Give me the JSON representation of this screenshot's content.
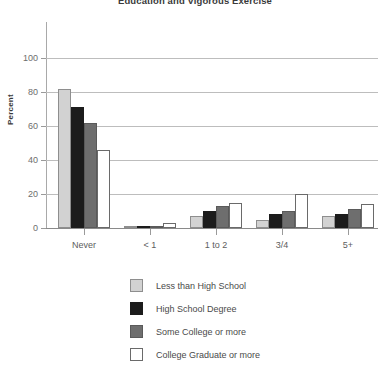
{
  "chart_data": {
    "type": "bar",
    "title": "Education and Vigorous Exercise",
    "xlabel": "",
    "ylabel": "Percent",
    "ylim": [
      0,
      100
    ],
    "yticks": [
      0,
      20,
      40,
      60,
      80,
      100
    ],
    "grid": true,
    "legend_position": "bottom",
    "categories": [
      "Never",
      "< 1",
      "1 to 2",
      "3/4",
      "5+"
    ],
    "series": [
      {
        "name": "Less than High School",
        "color": "#d2d2d2",
        "values": [
          82,
          1,
          7,
          5,
          7
        ]
      },
      {
        "name": "High School Degree",
        "color": "#1c1c1c",
        "values": [
          71,
          1,
          10,
          8,
          8
        ]
      },
      {
        "name": "Some College or more",
        "color": "#6e6e6e",
        "values": [
          62,
          1,
          13,
          10,
          11
        ]
      },
      {
        "name": "College Graduate or more",
        "color": "#ffffff",
        "values": [
          46,
          3,
          15,
          20,
          14
        ]
      }
    ]
  },
  "axis": {
    "y_title": "Percent",
    "y_tick_labels": [
      "0",
      "20",
      "40",
      "60",
      "80",
      "100"
    ],
    "x_tick_labels": [
      "Never",
      "< 1",
      "1 to 2",
      "3/4",
      "5+"
    ]
  },
  "legend": {
    "items": [
      {
        "label": "Less than High School"
      },
      {
        "label": "High School Degree"
      },
      {
        "label": "Some College or more"
      },
      {
        "label": "College Graduate or more"
      }
    ]
  }
}
